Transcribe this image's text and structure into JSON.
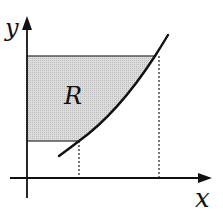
{
  "diagram": {
    "axis_x_label": "x",
    "axis_y_label": "y",
    "region_label": "R",
    "colors": {
      "axis": "#111111",
      "curve": "#111111",
      "region_fill": "#d4d4d4",
      "region_border": "#555555",
      "dashed": "#222222"
    }
  }
}
